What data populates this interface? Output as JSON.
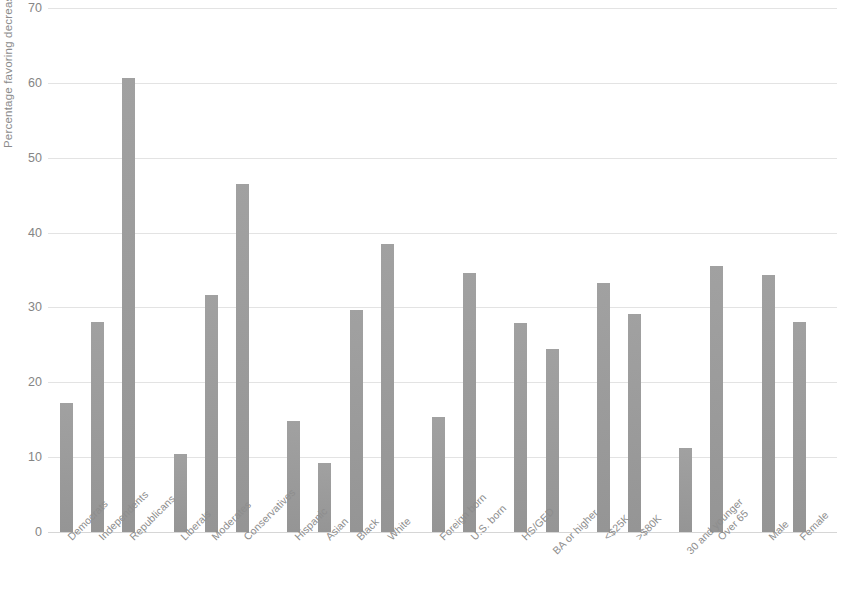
{
  "chart_data": {
    "type": "bar",
    "title": "",
    "subtitle": "",
    "xlabel": "",
    "ylabel": "Percentage favoring decreased immigration",
    "ylim": [
      0,
      70
    ],
    "yticks": [
      0,
      10,
      20,
      30,
      40,
      50,
      60,
      70
    ],
    "grid": true,
    "legend": false,
    "orientation": "vertical",
    "bar_color": "#9b9b9b",
    "grid_color": "#e3e3e3",
    "text_color": "#8d8d8d",
    "categories": [
      "Democrats",
      "Independents",
      "Republicans",
      "Liberals",
      "Moderates",
      "Conservatives",
      "Hispanic",
      "Asian",
      "Black",
      "White",
      "Foreign born",
      "U.S. born",
      "HS/GED",
      "BA or higher",
      "<$25K",
      ">$80K",
      "30 and younger",
      "Over 65",
      "Male",
      "Female"
    ],
    "values": [
      17.3,
      28.0,
      60.7,
      10.4,
      31.6,
      46.5,
      14.8,
      9.2,
      29.7,
      38.5,
      15.4,
      34.6,
      27.9,
      24.5,
      33.2,
      29.1,
      11.2,
      35.6,
      34.4,
      28.1
    ],
    "groups": [
      {
        "name": "Party",
        "members": [
          "Democrats",
          "Independents",
          "Republicans"
        ]
      },
      {
        "name": "Ideology",
        "members": [
          "Liberals",
          "Moderates",
          "Conservatives"
        ]
      },
      {
        "name": "Race/Ethnicity",
        "members": [
          "Hispanic",
          "Asian",
          "Black",
          "White"
        ]
      },
      {
        "name": "Nativity",
        "members": [
          "Foreign born",
          "U.S. born"
        ]
      },
      {
        "name": "Education",
        "members": [
          "HS/GED",
          "BA or higher"
        ]
      },
      {
        "name": "Income",
        "members": [
          "<$25K",
          ">$80K"
        ]
      },
      {
        "name": "Age",
        "members": [
          "30 and younger",
          "Over 65"
        ]
      },
      {
        "name": "Gender",
        "members": [
          "Male",
          "Female"
        ]
      }
    ],
    "series": [
      {
        "name": "Percentage favoring decreased immigration",
        "values": [
          17.3,
          28.0,
          60.7,
          10.4,
          31.6,
          46.5,
          14.8,
          9.2,
          29.7,
          38.5,
          15.4,
          34.6,
          27.9,
          24.5,
          33.2,
          29.1,
          11.2,
          35.6,
          34.4,
          28.1
        ]
      }
    ]
  }
}
